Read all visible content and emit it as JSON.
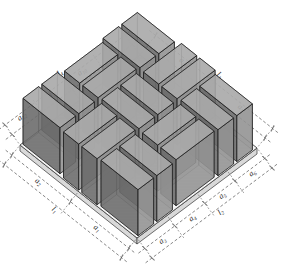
{
  "figure": {
    "width": 293,
    "height": 264
  },
  "colors": {
    "background": "#ffffff",
    "plate_top": "#f7f7f7",
    "plate_side": "#d9d9d9",
    "plate_stroke": "#4a4a4a",
    "hatch": "#d3d3d3",
    "block_top": "#a9a9a9",
    "block_side_se": "#8f8f8f",
    "block_side_sw": "#666666",
    "block_hidden": "#c2c2c2",
    "block_stroke": "#1c1c1c",
    "dim_line": "#555555",
    "label_color": "#222222"
  },
  "scene": {
    "projection": {
      "origin": [
        140,
        55
      ],
      "u_axis": [
        19.5,
        15.5
      ],
      "v_axis": [
        -20,
        15
      ]
    },
    "plate": {
      "units": 6,
      "thickness_px": 6
    },
    "block_height_px": 46,
    "blocks": [
      {
        "u0": 0.05,
        "v0": 0.18,
        "u1": 1.95,
        "v1": 0.96
      },
      {
        "u0": 0.05,
        "v0": 1.12,
        "u1": 1.95,
        "v1": 1.9
      },
      {
        "u0": 2.18,
        "v0": 0.05,
        "u1": 2.96,
        "v1": 1.95
      },
      {
        "u0": 3.12,
        "v0": 0.05,
        "u1": 3.9,
        "v1": 1.95
      },
      {
        "u0": 4.05,
        "v0": 0.18,
        "u1": 5.95,
        "v1": 0.96
      },
      {
        "u0": 4.05,
        "v0": 1.12,
        "u1": 5.95,
        "v1": 1.9
      },
      {
        "u0": 0.18,
        "v0": 2.05,
        "u1": 0.96,
        "v1": 3.95
      },
      {
        "u0": 1.12,
        "v0": 2.05,
        "u1": 1.9,
        "v1": 3.95
      },
      {
        "u0": 2.05,
        "v0": 2.18,
        "u1": 3.95,
        "v1": 2.96
      },
      {
        "u0": 2.05,
        "v0": 3.12,
        "u1": 3.95,
        "v1": 3.9
      },
      {
        "u0": 4.18,
        "v0": 2.05,
        "u1": 4.96,
        "v1": 3.95
      },
      {
        "u0": 5.12,
        "v0": 2.05,
        "u1": 5.9,
        "v1": 3.95
      },
      {
        "u0": 0.05,
        "v0": 4.18,
        "u1": 1.95,
        "v1": 4.96
      },
      {
        "u0": 0.05,
        "v0": 5.12,
        "u1": 1.95,
        "v1": 5.9
      },
      {
        "u0": 2.18,
        "v0": 4.05,
        "u1": 2.96,
        "v1": 5.95
      },
      {
        "u0": 3.12,
        "v0": 4.05,
        "u1": 3.9,
        "v1": 5.95
      },
      {
        "u0": 4.05,
        "v0": 4.18,
        "u1": 5.95,
        "v1": 4.96
      },
      {
        "u0": 4.05,
        "v0": 5.12,
        "u1": 5.95,
        "v1": 5.9
      }
    ],
    "dimension_edges": [
      {
        "id": "upper-left",
        "from": "L",
        "to": "T",
        "segments": [
          [
            "a",
            "12"
          ],
          [
            "a",
            "11"
          ],
          [
            "a",
            "10"
          ],
          [
            "a",
            "9"
          ]
        ],
        "total": [
          "l",
          "4"
        ],
        "total_fraction": 0.5
      },
      {
        "id": "upper-right",
        "from": "T",
        "to": "R",
        "segments": [
          [
            "a",
            "8"
          ],
          [
            "a",
            "7"
          ]
        ],
        "total": [
          "l",
          "3"
        ],
        "total_fraction": 0.5
      },
      {
        "id": "bottom-left",
        "from": "L",
        "to": "B",
        "segments": [
          [
            "a",
            "2"
          ],
          [
            "a",
            "1"
          ]
        ],
        "total": [
          "l",
          "1"
        ],
        "total_fraction": 0.45
      },
      {
        "id": "bottom-right",
        "from": "B",
        "to": "R",
        "segments": [
          [
            "a",
            "3"
          ],
          [
            "a",
            "4"
          ],
          [
            "a",
            "5"
          ],
          [
            "a",
            "6"
          ]
        ],
        "total": [
          "l",
          "2"
        ],
        "total_fraction": 0.55
      }
    ],
    "dimension_style": {
      "inner_offset": 13,
      "outer_offset": 25,
      "extension_len": 30,
      "label_offset": 6.5,
      "overshoot": 8
    }
  }
}
